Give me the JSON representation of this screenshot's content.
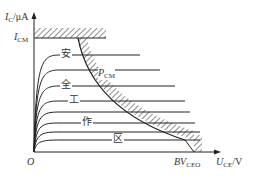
{
  "diagram": {
    "y_axis": {
      "symbol": "I",
      "sub": "C",
      "unit": "/μA"
    },
    "x_axis": {
      "symbol": "U",
      "sub": "CE",
      "unit": "/V"
    },
    "origin": "O",
    "icm_label": {
      "symbol": "I",
      "sub": "CM"
    },
    "pcm_label": {
      "symbol": "P",
      "sub": "CM"
    },
    "bv_label": {
      "symbol": "BV",
      "sub": "CEO"
    },
    "region_chars": [
      "安",
      "全",
      "工",
      "作",
      "区"
    ],
    "region_meaning": "safe operating region",
    "curve_count": 8,
    "colors": {
      "line": "#222222",
      "background": "#ffffff"
    }
  }
}
